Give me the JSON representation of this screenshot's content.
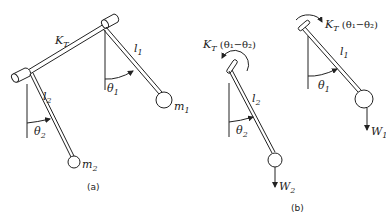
{
  "figure_a": {
    "spring_label": "K",
    "spring_sub": "T",
    "l1": "l",
    "l1_sub": "1",
    "l2": "l",
    "l2_sub": "2",
    "theta1": "θ",
    "theta1_sub": "1",
    "theta2": "θ",
    "theta2_sub": "2",
    "m1": "m",
    "m1_sub": "1",
    "m2": "m",
    "m2_sub": "2",
    "caption": "(a)"
  },
  "figure_b": {
    "left": {
      "torque_label": "K",
      "torque_sub": "T",
      "torque_expr": " (θ₁−θ₂)",
      "l2": "l",
      "l2_sub": "2",
      "theta2": "θ",
      "theta2_sub": "2",
      "weight": "W",
      "weight_sub": "2"
    },
    "right": {
      "torque_label": "K",
      "torque_sub": "T",
      "torque_expr": " (θ₁−θ₂)",
      "l1": "l",
      "l1_sub": "1",
      "theta1": "θ",
      "theta1_sub": "1",
      "weight": "W",
      "weight_sub": "1"
    },
    "caption": "(b)"
  }
}
